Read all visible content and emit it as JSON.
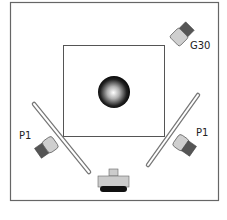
{
  "diagram": {
    "type": "lighting-setup",
    "labels": {
      "top_right_light": "G30",
      "left_light": "P1",
      "right_light": "P1"
    },
    "colors": {
      "border": "#666666",
      "light_head": "#cfcfcf",
      "light_body": "#555555",
      "reflector_stroke": "#777777",
      "camera_body": "#cccccc",
      "camera_base": "#111111"
    },
    "elements": [
      {
        "name": "outer-frame"
      },
      {
        "name": "backdrop-square"
      },
      {
        "name": "subject-sphere"
      },
      {
        "name": "light-g30"
      },
      {
        "name": "light-p1-left"
      },
      {
        "name": "light-p1-right"
      },
      {
        "name": "reflector-left"
      },
      {
        "name": "reflector-right"
      },
      {
        "name": "camera"
      }
    ]
  }
}
